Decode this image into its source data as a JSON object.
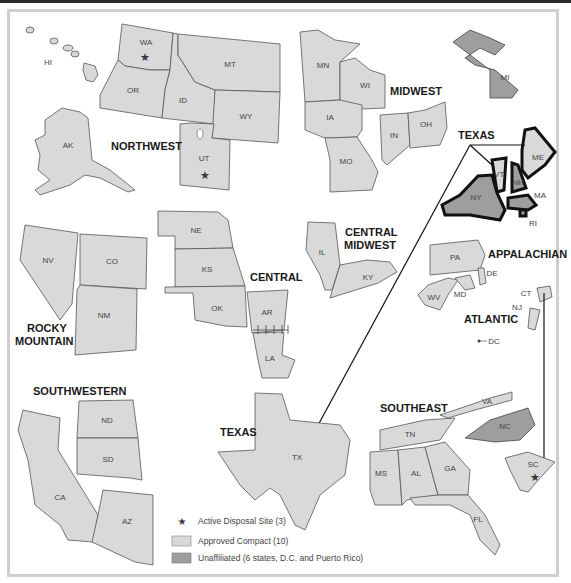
{
  "colors": {
    "approved_compact": "#d9d9d9",
    "unaffiliated": "#9e9e9e",
    "border": "#555555",
    "star": "#3a3a3a",
    "frame": "#cfcfcf"
  },
  "regions": {
    "northwest": "NORTHWEST",
    "midwest": "MIDWEST",
    "texas_top": "TEXAS",
    "rocky_mountain_1": "ROCKY",
    "rocky_mountain_2": "MOUNTAIN",
    "central": "CENTRAL",
    "central_midwest_1": "CENTRAL",
    "central_midwest_2": "MIDWEST",
    "appalachian": "APPALACHIAN",
    "atlantic": "ATLANTIC",
    "southwestern": "SOUTHWESTERN",
    "texas": "TEXAS",
    "southeast": "SOUTHEAST"
  },
  "states": {
    "HI": "HI",
    "WA": "WA",
    "OR": "OR",
    "ID": "ID",
    "MT": "MT",
    "WY": "WY",
    "AK": "AK",
    "UT": "UT",
    "MN": "MN",
    "WI": "WI",
    "IA": "IA",
    "MO": "MO",
    "IN": "IN",
    "OH": "OH",
    "MI": "MI",
    "ME": "ME",
    "VT": "VT",
    "NH": "NH",
    "MA": "MA",
    "NY": "NY",
    "RI": "RI",
    "NV": "NV",
    "CO": "CO",
    "NM": "NM",
    "NE": "NE",
    "KS": "KS",
    "OK": "OK",
    "AR": "AR",
    "LA": "LA",
    "IL": "IL",
    "KY": "KY",
    "PA": "PA",
    "DE": "DE",
    "MD": "MD",
    "WV": "WV",
    "CT": "CT",
    "NJ": "NJ",
    "DC": "DC",
    "ND": "ND",
    "SD": "SD",
    "CA": "CA",
    "AZ": "AZ",
    "TX": "TX",
    "VA": "VA",
    "NC": "NC",
    "TN": "TN",
    "MS": "MS",
    "AL": "AL",
    "GA": "GA",
    "FL": "FL",
    "SC": "SC"
  },
  "legend": {
    "active_site": "Active Disposal Site (3)",
    "approved": "Approved Compact (10)",
    "unaffiliated": "Unaffiliated (6 states, D.C. and Puerto Rico)"
  }
}
